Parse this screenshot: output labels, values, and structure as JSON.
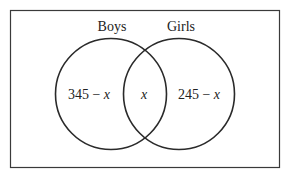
{
  "diagram": {
    "type": "venn",
    "sets": [
      {
        "name": "Boys",
        "label": "Boys"
      },
      {
        "name": "Girls",
        "label": "Girls"
      }
    ],
    "regions": {
      "boys_only": {
        "number": "345",
        "minus": " − ",
        "var": "x"
      },
      "both": {
        "var": "x"
      },
      "girls_only": {
        "number": "245",
        "minus": " − ",
        "var": "x"
      }
    },
    "colors": {
      "stroke": "#2a2a2a",
      "text": "#222222",
      "background": "#ffffff"
    }
  }
}
